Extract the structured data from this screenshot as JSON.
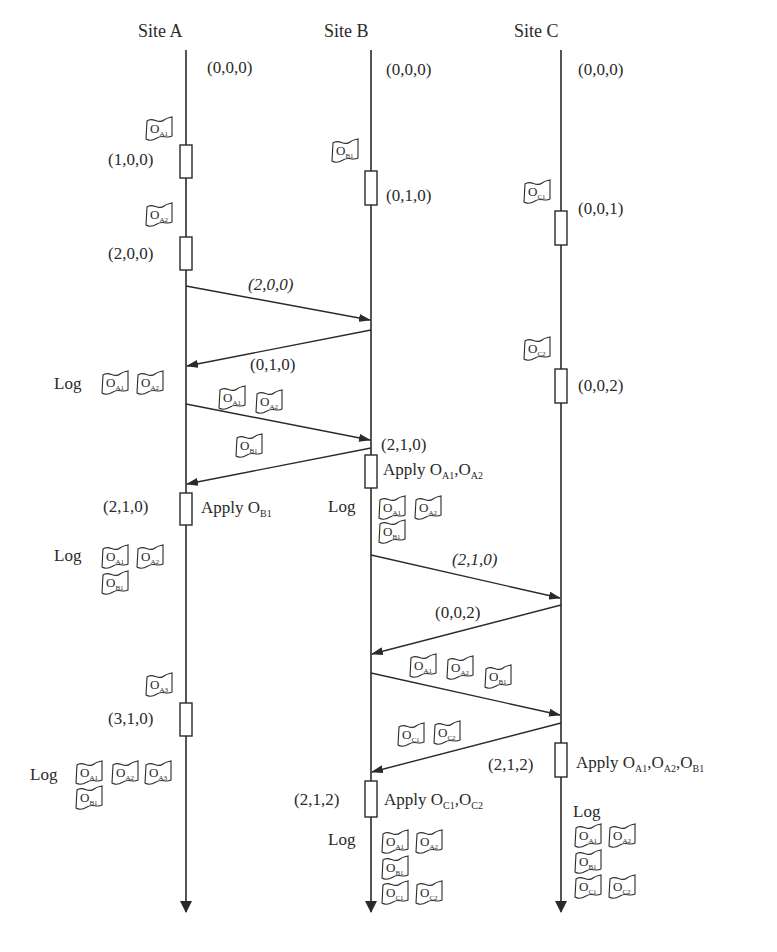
{
  "sites": [
    {
      "id": "A",
      "label": "Site A",
      "x": 186,
      "label_x": 138
    },
    {
      "id": "B",
      "label": "Site B",
      "x": 371,
      "label_x": 324
    },
    {
      "id": "C",
      "label": "Site C",
      "x": 561,
      "label_x": 514
    }
  ],
  "timeline": {
    "top": 50,
    "bottom": 912
  },
  "vector_clocks": [
    {
      "text": "(0,0,0)",
      "x": 207,
      "y": 59
    },
    {
      "text": "(0,0,0)",
      "x": 386,
      "y": 61
    },
    {
      "text": "(0,0,0)",
      "x": 578,
      "y": 61
    },
    {
      "text": "(1,0,0)",
      "x": 108,
      "y": 151
    },
    {
      "text": "(0,1,0)",
      "x": 386,
      "y": 187
    },
    {
      "text": "(0,0,1)",
      "x": 578,
      "y": 200
    },
    {
      "text": "(2,0,0)",
      "x": 108,
      "y": 245
    },
    {
      "text": "(0,0,2)",
      "x": 578,
      "y": 377
    },
    {
      "text": "(2,1,0)",
      "x": 381,
      "y": 436
    },
    {
      "text": "(2,1,0)",
      "x": 103,
      "y": 498
    },
    {
      "text": "(3,1,0)",
      "x": 108,
      "y": 710
    },
    {
      "text": "(2,1,2)",
      "x": 488,
      "y": 756
    },
    {
      "text": "(2,1,2)",
      "x": 294,
      "y": 791
    }
  ],
  "event_boxes": [
    {
      "site": "A",
      "y1": 145,
      "y2": 178
    },
    {
      "site": "A",
      "y1": 237,
      "y2": 270
    },
    {
      "site": "A",
      "y1": 493,
      "y2": 525
    },
    {
      "site": "A",
      "y1": 703,
      "y2": 736
    },
    {
      "site": "B",
      "y1": 171,
      "y2": 205
    },
    {
      "site": "B",
      "y1": 455,
      "y2": 488
    },
    {
      "site": "B",
      "y1": 781,
      "y2": 817
    },
    {
      "site": "C",
      "y1": 211,
      "y2": 245
    },
    {
      "site": "C",
      "y1": 369,
      "y2": 403
    },
    {
      "site": "C",
      "y1": 743,
      "y2": 777
    }
  ],
  "messages": [
    {
      "from": "A",
      "to": "B",
      "y1": 286,
      "y2": 320,
      "label": "(2,0,0)",
      "label_x": 248,
      "label_y": 276,
      "italic": true
    },
    {
      "from": "B",
      "to": "A",
      "y1": 330,
      "y2": 366,
      "label": "(0,1,0)",
      "label_x": 250,
      "label_y": 356,
      "italic": false
    },
    {
      "from": "A",
      "to": "B",
      "y1": 404,
      "y2": 440,
      "label": "",
      "ops": [
        "A1",
        "A2"
      ]
    },
    {
      "from": "B",
      "to": "A",
      "y1": 448,
      "y2": 484,
      "label": "",
      "ops": [
        "B1"
      ]
    },
    {
      "from": "B",
      "to": "C",
      "y1": 555,
      "y2": 598,
      "label": "(2,1,0)",
      "label_x": 452,
      "label_y": 551,
      "italic": true
    },
    {
      "from": "C",
      "to": "B",
      "y1": 605,
      "y2": 654,
      "label": "(0,0,2)",
      "label_x": 435,
      "label_y": 604,
      "italic": false
    },
    {
      "from": "B",
      "to": "C",
      "y1": 673,
      "y2": 715,
      "label": "",
      "ops": [
        "A1",
        "A2",
        "B1"
      ]
    },
    {
      "from": "C",
      "to": "B",
      "y1": 723,
      "y2": 772,
      "label": "",
      "ops": [
        "C1",
        "C2"
      ]
    }
  ],
  "apply_labels": [
    {
      "text": "Apply O",
      "subs": [
        "B1"
      ],
      "x": 201,
      "y": 499
    },
    {
      "text": "Apply O",
      "subs": [
        "A1",
        "A2"
      ],
      "x": 383,
      "y": 461
    },
    {
      "text": "Apply O",
      "subs": [
        "A1",
        "A2",
        "B1"
      ],
      "x": 576,
      "y": 754
    },
    {
      "text": "Apply O",
      "subs": [
        "C1",
        "C2"
      ],
      "x": 384,
      "y": 791
    }
  ],
  "log_labels": [
    {
      "text": "Log",
      "x": 54,
      "y": 375
    },
    {
      "text": "Log",
      "x": 328,
      "y": 498
    },
    {
      "text": "Log",
      "x": 54,
      "y": 547
    },
    {
      "text": "Log",
      "x": 30,
      "y": 766
    },
    {
      "text": "Log",
      "x": 328,
      "y": 831
    },
    {
      "text": "Log",
      "x": 573,
      "y": 803
    }
  ],
  "operations": [
    {
      "op": "A1",
      "x": 144,
      "y": 116
    },
    {
      "op": "A2",
      "x": 144,
      "y": 202
    },
    {
      "op": "B1",
      "x": 330,
      "y": 138
    },
    {
      "op": "C1",
      "x": 522,
      "y": 179
    },
    {
      "op": "C2",
      "x": 522,
      "y": 336
    },
    {
      "op": "A1",
      "x": 100,
      "y": 370
    },
    {
      "op": "A2",
      "x": 135,
      "y": 370
    },
    {
      "op": "A1",
      "x": 217,
      "y": 385
    },
    {
      "op": "A2",
      "x": 254,
      "y": 389
    },
    {
      "op": "B1",
      "x": 234,
      "y": 433
    },
    {
      "op": "A1",
      "x": 377,
      "y": 495
    },
    {
      "op": "A2",
      "x": 413,
      "y": 495
    },
    {
      "op": "B1",
      "x": 377,
      "y": 519
    },
    {
      "op": "A1",
      "x": 100,
      "y": 544
    },
    {
      "op": "A2",
      "x": 135,
      "y": 544
    },
    {
      "op": "B1",
      "x": 100,
      "y": 570
    },
    {
      "op": "A1",
      "x": 408,
      "y": 653
    },
    {
      "op": "A2",
      "x": 445,
      "y": 655
    },
    {
      "op": "B1",
      "x": 483,
      "y": 664
    },
    {
      "op": "A3",
      "x": 144,
      "y": 672
    },
    {
      "op": "C1",
      "x": 396,
      "y": 722
    },
    {
      "op": "C2",
      "x": 432,
      "y": 720
    },
    {
      "op": "A1",
      "x": 74,
      "y": 760
    },
    {
      "op": "A2",
      "x": 110,
      "y": 760
    },
    {
      "op": "A3",
      "x": 143,
      "y": 760
    },
    {
      "op": "B1",
      "x": 74,
      "y": 785
    },
    {
      "op": "A1",
      "x": 380,
      "y": 829
    },
    {
      "op": "A2",
      "x": 414,
      "y": 829
    },
    {
      "op": "B1",
      "x": 380,
      "y": 855
    },
    {
      "op": "C1",
      "x": 380,
      "y": 880
    },
    {
      "op": "C2",
      "x": 414,
      "y": 880
    },
    {
      "op": "A1",
      "x": 573,
      "y": 823
    },
    {
      "op": "A2",
      "x": 607,
      "y": 823
    },
    {
      "op": "B1",
      "x": 573,
      "y": 849
    },
    {
      "op": "C1",
      "x": 573,
      "y": 874
    },
    {
      "op": "C2",
      "x": 607,
      "y": 874
    }
  ],
  "style": {
    "ink": "#2a2a2a",
    "background": "#ffffff"
  }
}
